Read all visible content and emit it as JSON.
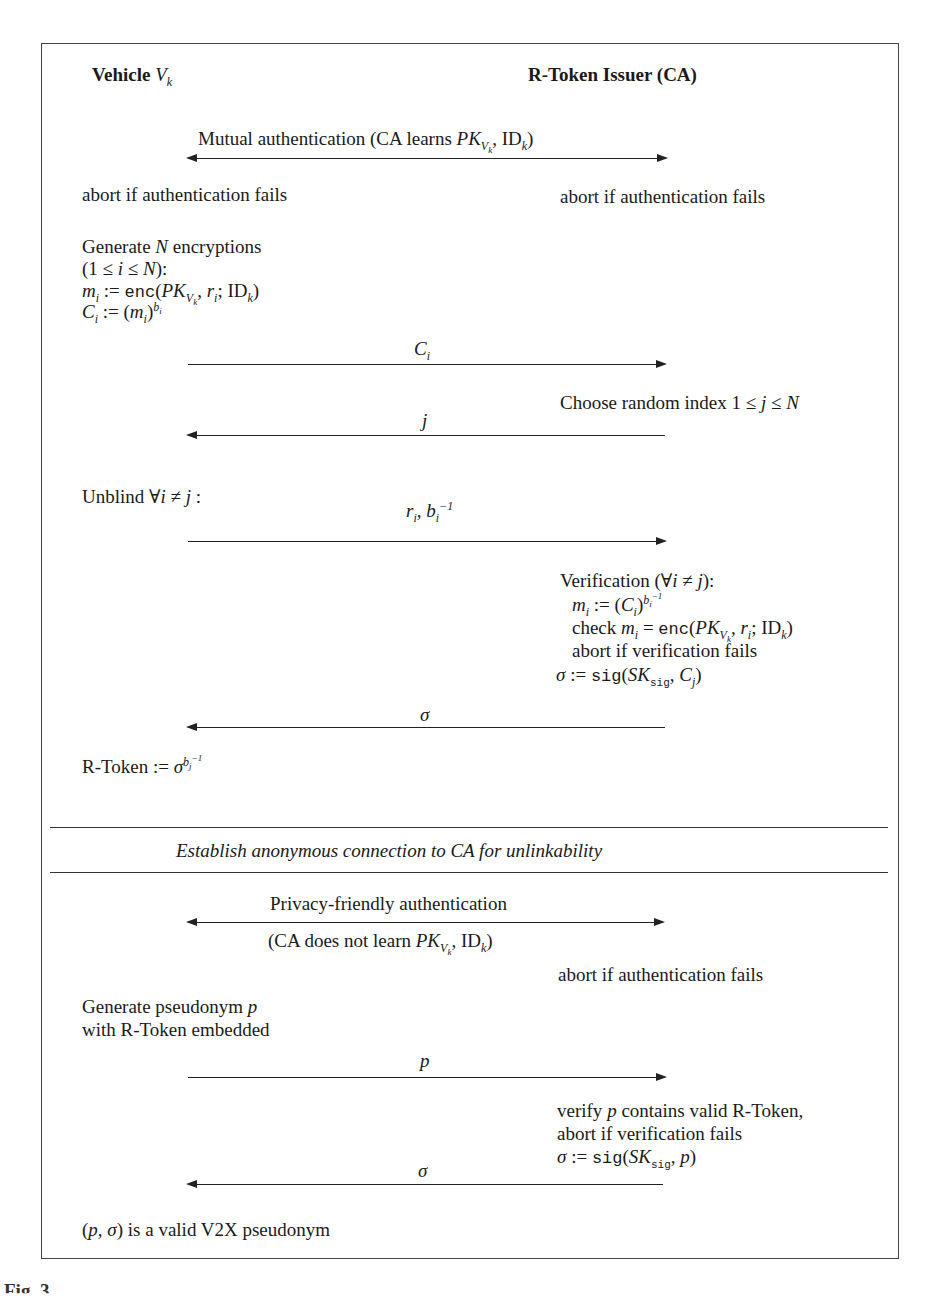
{
  "diagram": {
    "type": "protocol-sequence",
    "parties": {
      "left": {
        "label": "Vehicle",
        "var": "V",
        "sub": "k"
      },
      "right": {
        "label": "R-Token Issuer (CA)"
      }
    },
    "phase1": {
      "mutual_auth": {
        "label": "Mutual authentication (CA learns ",
        "pk": "PK",
        "pk_sub": "V",
        "pk_subsub": "k",
        "id": "ID",
        "id_sub": "k",
        "close": ")"
      },
      "abort_left": "abort if authentication fails",
      "abort_right": "abort if authentication fails",
      "generate": {
        "line1_a": "Generate ",
        "line1_var": "N",
        "line1_b": " encryptions",
        "line2": "(1 ≤ i ≤ N):",
        "line3": "mᵢ := enc(PK_Vk, rᵢ; IDₖ)",
        "line4": "Cᵢ := (mᵢ)^bᵢ"
      },
      "msg_ci": "C",
      "msg_ci_sub": "i",
      "choose_index": "Choose random index 1 ≤ j ≤ N",
      "msg_j": "j",
      "unblind": "Unblind ∀i ≠ j :",
      "msg_unblind": "rᵢ, bᵢ⁻¹",
      "verification": {
        "title": "Verification (∀i ≠ j):",
        "line1": "mᵢ := (Cᵢ)^(bᵢ⁻¹)",
        "line2": "check mᵢ = enc(PK_Vk, rᵢ; IDₖ)",
        "line3": "abort if verification fails",
        "line4": "σ := sig(SK_sig, Cⱼ)"
      },
      "msg_sigma": "σ",
      "rtoken": "R-Token := σ^(bⱼ⁻¹)"
    },
    "separator": {
      "label": "Establish anonymous connection to CA for unlinkability"
    },
    "phase2": {
      "privacy_auth": "Privacy-friendly authentication",
      "privacy_auth_note": "(CA does not learn PK_Vk, IDₖ)",
      "abort_right": "abort if authentication fails",
      "generate_line1": "Generate pseudonym p",
      "generate_line2": "with R-Token embedded",
      "msg_p": "p",
      "verify_line1": "verify p contains valid R-Token,",
      "verify_line2": "abort if verification fails",
      "verify_line3": "σ := sig(SK_sig, p)",
      "msg_sigma": "σ",
      "result": "(p, σ) is a valid V2X pseudonym"
    },
    "caption_fragment": "Fig. 3."
  }
}
